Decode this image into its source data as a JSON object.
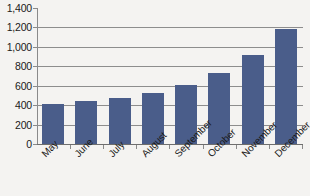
{
  "chart_data": {
    "type": "bar",
    "title": "",
    "subtitle": "",
    "xlabel": "",
    "ylabel": "",
    "categories": [
      "May",
      "June",
      "July",
      "August",
      "September",
      "October",
      "November",
      "December"
    ],
    "values": [
      415,
      440,
      470,
      530,
      605,
      735,
      915,
      1185
    ],
    "series": [
      {
        "name": "",
        "values": [
          415,
          440,
          470,
          530,
          605,
          735,
          915,
          1185
        ]
      }
    ],
    "ylim": [
      0,
      1400
    ],
    "ytick_values": [
      0,
      200,
      400,
      600,
      800,
      1000,
      1200,
      1400
    ],
    "ytick_labels": [
      "0",
      "200",
      "400",
      "600",
      "800",
      "1,000",
      "1,200",
      "1,400"
    ],
    "grid": true,
    "grid_axis": "y",
    "legend": false,
    "legend_position": "none",
    "annotations": [],
    "bar_color": "#4a5d8a",
    "gridline_color": "#8d8d8d",
    "axis_color": "#8a8a8a",
    "background_color": "#f4f3f1",
    "text_color": "#1a1a1a",
    "xtick_label_rotation": "-45"
  }
}
